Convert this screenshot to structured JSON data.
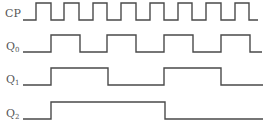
{
  "signals": [
    {
      "name": "CP",
      "label": "CP",
      "sub": "",
      "label_y": 17,
      "low_y": 20,
      "high_y": 3,
      "x_start": 23,
      "x_end": 258,
      "edges": [
        36,
        51,
        64,
        79,
        93,
        107,
        121,
        136,
        150,
        164,
        178,
        192,
        206,
        221,
        235,
        249
      ],
      "start_level": 0
    },
    {
      "name": "Q0",
      "label": "Q",
      "sub": "0",
      "label_y": 50,
      "low_y": 52,
      "high_y": 35,
      "x_start": 23,
      "x_end": 262,
      "edges": [
        51,
        80,
        107,
        136,
        164,
        193,
        221,
        250
      ],
      "start_level": 0
    },
    {
      "name": "Q1",
      "label": "Q",
      "sub": "1",
      "label_y": 83,
      "low_y": 85,
      "high_y": 68,
      "x_start": 23,
      "x_end": 263,
      "edges": [
        51,
        108,
        164,
        221
      ],
      "start_level": 0
    },
    {
      "name": "Q2",
      "label": "Q",
      "sub": "2",
      "label_y": 117,
      "low_y": 119,
      "high_y": 102,
      "x_start": 23,
      "x_end": 263,
      "edges": [
        51,
        165
      ],
      "start_level": 0
    }
  ],
  "colors": {
    "line": "#4a4a4a",
    "label": "#555555",
    "background": "#ffffff"
  }
}
